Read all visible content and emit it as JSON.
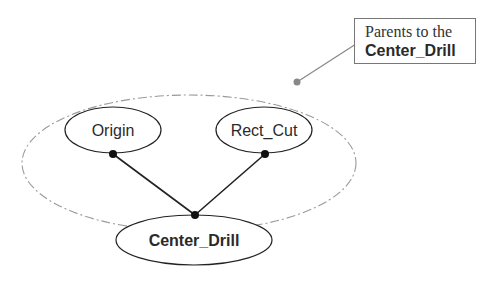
{
  "diagram": {
    "group": {
      "label_line1": "Parents to the",
      "label_line2": "Center_Drill",
      "border_style": "dash-dot",
      "color": "#999999"
    },
    "nodes": [
      {
        "id": "origin",
        "label": "Origin",
        "bold": false
      },
      {
        "id": "rect_cut",
        "label": "Rect_Cut",
        "bold": false
      },
      {
        "id": "center_drill",
        "label": "Center_Drill",
        "bold": true
      }
    ],
    "edges": [
      {
        "from": "origin",
        "to": "center_drill"
      },
      {
        "from": "rect_cut",
        "to": "center_drill"
      }
    ],
    "colors": {
      "line": "#222222",
      "dot": "#111111",
      "callout_dot": "#888888",
      "callout_border": "#777777"
    }
  }
}
